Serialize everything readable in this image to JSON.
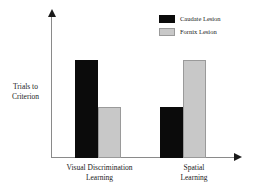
{
  "chart_data": {
    "type": "bar",
    "title": "",
    "subtitle": "",
    "xlabel": "",
    "ylabel": "Trials to Criterion",
    "ylabel_lines": [
      "Trials to",
      "Criterion"
    ],
    "categories": [
      "Visual Discrimination Learning",
      "Spatial Learning"
    ],
    "category_lines": [
      [
        "Visual Discrimination",
        "Learning"
      ],
      [
        "Spatial",
        "Learning"
      ]
    ],
    "series": [
      {
        "name": "Caudate Lesion",
        "color": "#0b0b0b",
        "values": [
          100,
          52
        ]
      },
      {
        "name": "Fornix Lesion",
        "color": "#c8c8c8",
        "values": [
          52,
          100
        ]
      }
    ],
    "ylim": [
      0,
      125
    ],
    "y_ticks": [],
    "x_ticks_shown": false,
    "grid": false,
    "legend_position": "top-right",
    "axis_style": "arrow-ended",
    "annotations": []
  },
  "legend": {
    "entries": [
      {
        "label": "Caudate Lesion",
        "swatch": "dark"
      },
      {
        "label": "Fornix Lesion",
        "swatch": "light"
      }
    ]
  },
  "colors": {
    "axis": "#8a8a8a",
    "arrow": "#1a1a1a",
    "dark_bar": "#0b0b0b",
    "light_bar": "#c8c8c8",
    "light_bar_border": "#9a9a9a",
    "background": "#ffffff",
    "text": "#1a1a1a"
  }
}
